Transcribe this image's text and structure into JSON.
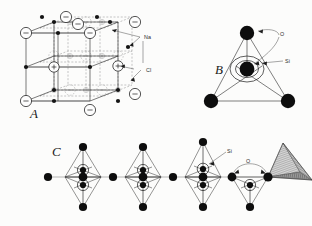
{
  "figure": {
    "background": "#fcfcfb",
    "ink": "#1a1a1a",
    "width": 312,
    "height": 226
  },
  "panels": [
    {
      "id": "A",
      "letter": "A",
      "name": "sodium-chloride-unit-cell",
      "labels": [
        {
          "text": "Na",
          "name": "label-na",
          "x": 144,
          "y": 38
        },
        {
          "text": "Cl",
          "name": "label-cl",
          "x": 146,
          "y": 71
        }
      ]
    },
    {
      "id": "B",
      "letter": "B",
      "name": "silica-tetrahedron",
      "labels": [
        {
          "text": "O",
          "name": "label-o",
          "x": 281,
          "y": 35
        },
        {
          "text": "Si",
          "name": "label-si",
          "x": 286,
          "y": 62
        }
      ]
    },
    {
      "id": "C",
      "letter": "C",
      "name": "single-chain-silicate",
      "labels": [
        {
          "text": "Si",
          "name": "label-si-chain",
          "x": 228,
          "y": 153
        },
        {
          "text": "O",
          "name": "label-o-chain",
          "x": 239,
          "y": 163
        }
      ]
    }
  ],
  "species": {
    "na": {
      "symbol": "Na",
      "role": "sodium-cation",
      "color": "#141414"
    },
    "cl": {
      "symbol": "Cl",
      "role": "chloride-anion",
      "color": "#fdfdfd"
    },
    "o": {
      "symbol": "O",
      "role": "oxygen",
      "color": "#0d0d0d"
    },
    "si": {
      "symbol": "Si",
      "role": "silicon",
      "color": "#0d0d0d"
    }
  },
  "panel_letters": {
    "a": "A",
    "b": "B",
    "c": "C"
  }
}
